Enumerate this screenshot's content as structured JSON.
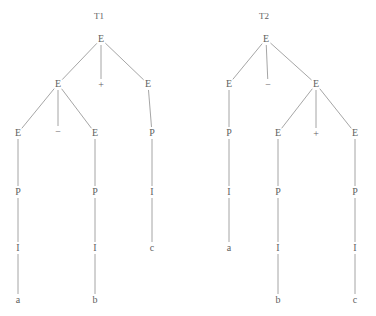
{
  "figure": {
    "caption_absent": true,
    "background_color": "#ffffff",
    "edge_color": "#8e8e8e",
    "text_color": "#5f5f5f",
    "width": 376,
    "height": 316
  },
  "trees": [
    {
      "id": "T1",
      "label": "T1",
      "label_pos": {
        "x": 99,
        "y": 16
      },
      "nodes": [
        {
          "id": "t1-n0",
          "label": "E",
          "x": 101,
          "y": 39,
          "kind": "nonterminal"
        },
        {
          "id": "t1-n1",
          "label": "E",
          "x": 58,
          "y": 84,
          "kind": "nonterminal"
        },
        {
          "id": "t1-n2",
          "label": "+",
          "x": 101,
          "y": 85,
          "kind": "operator"
        },
        {
          "id": "t1-n3",
          "label": "E",
          "x": 148,
          "y": 84,
          "kind": "nonterminal"
        },
        {
          "id": "t1-n4",
          "label": "E",
          "x": 18,
          "y": 133,
          "kind": "nonterminal"
        },
        {
          "id": "t1-n5",
          "label": "−",
          "x": 58,
          "y": 132,
          "kind": "operator"
        },
        {
          "id": "t1-n6",
          "label": "E",
          "x": 95,
          "y": 133,
          "kind": "nonterminal"
        },
        {
          "id": "t1-n7",
          "label": "P",
          "x": 152,
          "y": 133,
          "kind": "nonterminal"
        },
        {
          "id": "t1-n8",
          "label": "P",
          "x": 18,
          "y": 192,
          "kind": "nonterminal"
        },
        {
          "id": "t1-n9",
          "label": "P",
          "x": 95,
          "y": 192,
          "kind": "nonterminal"
        },
        {
          "id": "t1-n10",
          "label": "I",
          "x": 152,
          "y": 192,
          "kind": "nonterminal"
        },
        {
          "id": "t1-n11",
          "label": "I",
          "x": 18,
          "y": 248,
          "kind": "nonterminal"
        },
        {
          "id": "t1-n12",
          "label": "I",
          "x": 95,
          "y": 248,
          "kind": "nonterminal"
        },
        {
          "id": "t1-n13",
          "label": "c",
          "x": 152,
          "y": 248,
          "kind": "terminal"
        },
        {
          "id": "t1-n14",
          "label": "a",
          "x": 18,
          "y": 300,
          "kind": "terminal"
        },
        {
          "id": "t1-n15",
          "label": "b",
          "x": 95,
          "y": 300,
          "kind": "terminal"
        }
      ],
      "edges": [
        {
          "from": "t1-n0",
          "to": "t1-n1"
        },
        {
          "from": "t1-n0",
          "to": "t1-n2"
        },
        {
          "from": "t1-n0",
          "to": "t1-n3"
        },
        {
          "from": "t1-n1",
          "to": "t1-n4"
        },
        {
          "from": "t1-n1",
          "to": "t1-n5"
        },
        {
          "from": "t1-n1",
          "to": "t1-n6"
        },
        {
          "from": "t1-n3",
          "to": "t1-n7"
        },
        {
          "from": "t1-n4",
          "to": "t1-n8"
        },
        {
          "from": "t1-n6",
          "to": "t1-n9"
        },
        {
          "from": "t1-n7",
          "to": "t1-n10"
        },
        {
          "from": "t1-n8",
          "to": "t1-n11"
        },
        {
          "from": "t1-n9",
          "to": "t1-n12"
        },
        {
          "from": "t1-n10",
          "to": "t1-n13"
        },
        {
          "from": "t1-n11",
          "to": "t1-n14"
        },
        {
          "from": "t1-n12",
          "to": "t1-n15"
        }
      ]
    },
    {
      "id": "T2",
      "label": "T2",
      "label_pos": {
        "x": 264,
        "y": 16
      },
      "nodes": [
        {
          "id": "t2-n0",
          "label": "E",
          "x": 266,
          "y": 39,
          "kind": "nonterminal"
        },
        {
          "id": "t2-n1",
          "label": "E",
          "x": 229,
          "y": 84,
          "kind": "nonterminal"
        },
        {
          "id": "t2-n2",
          "label": "−",
          "x": 268,
          "y": 85,
          "kind": "operator"
        },
        {
          "id": "t2-n3",
          "label": "E",
          "x": 316,
          "y": 84,
          "kind": "nonterminal"
        },
        {
          "id": "t2-n4",
          "label": "P",
          "x": 229,
          "y": 133,
          "kind": "nonterminal"
        },
        {
          "id": "t2-n5",
          "label": "E",
          "x": 278,
          "y": 133,
          "kind": "nonterminal"
        },
        {
          "id": "t2-n6",
          "label": "+",
          "x": 316,
          "y": 134,
          "kind": "operator"
        },
        {
          "id": "t2-n7",
          "label": "E",
          "x": 355,
          "y": 133,
          "kind": "nonterminal"
        },
        {
          "id": "t2-n8",
          "label": "I",
          "x": 229,
          "y": 192,
          "kind": "nonterminal"
        },
        {
          "id": "t2-n9",
          "label": "P",
          "x": 278,
          "y": 192,
          "kind": "nonterminal"
        },
        {
          "id": "t2-n10",
          "label": "P",
          "x": 355,
          "y": 192,
          "kind": "nonterminal"
        },
        {
          "id": "t2-n11",
          "label": "a",
          "x": 229,
          "y": 248,
          "kind": "terminal"
        },
        {
          "id": "t2-n12",
          "label": "I",
          "x": 278,
          "y": 248,
          "kind": "nonterminal"
        },
        {
          "id": "t2-n13",
          "label": "I",
          "x": 355,
          "y": 248,
          "kind": "nonterminal"
        },
        {
          "id": "t2-n14",
          "label": "b",
          "x": 278,
          "y": 300,
          "kind": "terminal"
        },
        {
          "id": "t2-n15",
          "label": "c",
          "x": 355,
          "y": 300,
          "kind": "terminal"
        }
      ],
      "edges": [
        {
          "from": "t2-n0",
          "to": "t2-n1"
        },
        {
          "from": "t2-n0",
          "to": "t2-n2"
        },
        {
          "from": "t2-n0",
          "to": "t2-n3"
        },
        {
          "from": "t2-n1",
          "to": "t2-n4"
        },
        {
          "from": "t2-n3",
          "to": "t2-n5"
        },
        {
          "from": "t2-n3",
          "to": "t2-n6"
        },
        {
          "from": "t2-n3",
          "to": "t2-n7"
        },
        {
          "from": "t2-n4",
          "to": "t2-n8"
        },
        {
          "from": "t2-n5",
          "to": "t2-n9"
        },
        {
          "from": "t2-n7",
          "to": "t2-n10"
        },
        {
          "from": "t2-n8",
          "to": "t2-n11"
        },
        {
          "from": "t2-n9",
          "to": "t2-n12"
        },
        {
          "from": "t2-n10",
          "to": "t2-n13"
        },
        {
          "from": "t2-n12",
          "to": "t2-n14"
        },
        {
          "from": "t2-n13",
          "to": "t2-n15"
        }
      ]
    }
  ]
}
